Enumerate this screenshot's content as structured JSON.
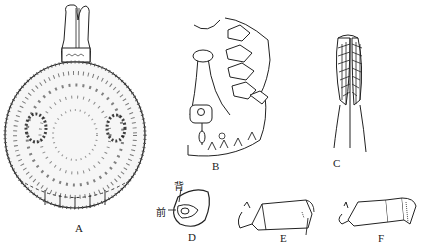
{
  "figure": {
    "panels": [
      {
        "id": "A",
        "label": "A",
        "description": "dorsal view of tick body with capitulum"
      },
      {
        "id": "B",
        "label": "B",
        "description": "ventral half view with legs and spiracle"
      },
      {
        "id": "C",
        "label": "C",
        "description": "hypostome with denticles"
      },
      {
        "id": "D",
        "label": "D",
        "description": "spiracular plate"
      },
      {
        "id": "E",
        "label": "E",
        "description": "leg segment (tarsus)"
      },
      {
        "id": "F",
        "label": "F",
        "description": "leg segment (tarsus)"
      }
    ],
    "annotations": {
      "dorsal": "背",
      "anterior": "前"
    }
  }
}
